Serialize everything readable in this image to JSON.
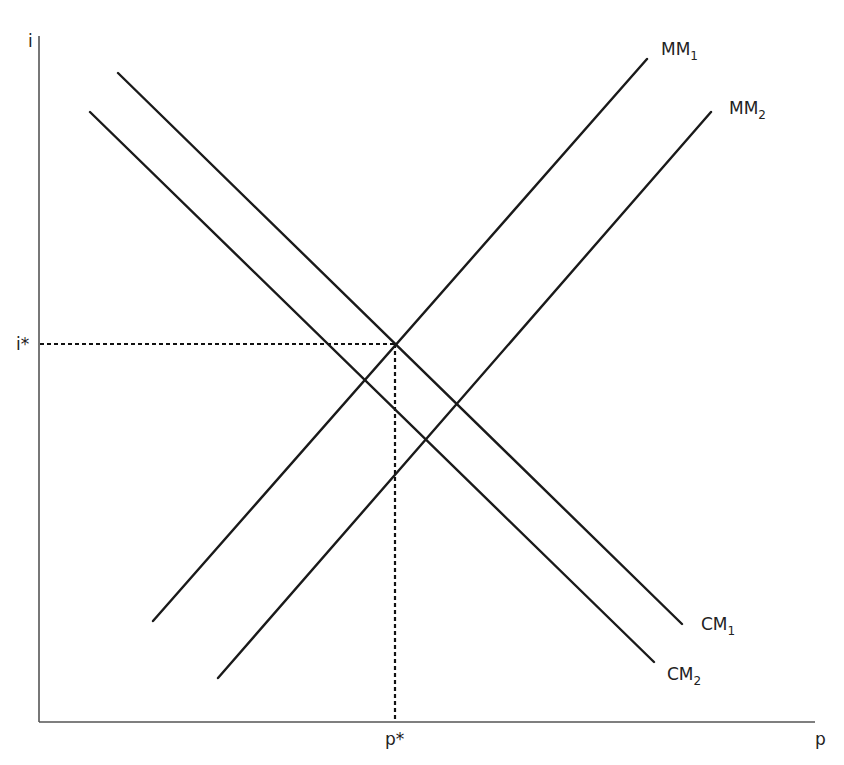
{
  "diagram": {
    "axes": {
      "y_label": "i",
      "x_label": "p"
    },
    "equilibrium": {
      "i_label": "i*",
      "p_label": "p*"
    },
    "curves": [
      {
        "id": "MM1",
        "base": "MM",
        "sub": "1",
        "x1": 153,
        "y1": 621,
        "x2": 647,
        "y2": 59
      },
      {
        "id": "MM2",
        "base": "MM",
        "sub": "2",
        "x1": 218,
        "y1": 678,
        "x2": 711,
        "y2": 112
      },
      {
        "id": "CM1",
        "base": "CM",
        "sub": "1",
        "x1": 118,
        "y1": 73,
        "x2": 682,
        "y2": 624
      },
      {
        "id": "CM2",
        "base": "CM",
        "sub": "2",
        "x1": 90,
        "y1": 112,
        "x2": 654,
        "y2": 662
      }
    ],
    "line_color": "#1a1a1a",
    "axis_color": "#555555"
  },
  "chart_data": {
    "type": "line",
    "title": "",
    "xlabel": "p",
    "ylabel": "i",
    "series": [
      {
        "name": "MM1",
        "direction": "upward-sloping"
      },
      {
        "name": "MM2",
        "direction": "upward-sloping (shifted right)"
      },
      {
        "name": "CM1",
        "direction": "downward-sloping"
      },
      {
        "name": "CM2",
        "direction": "downward-sloping (shifted left)"
      }
    ],
    "annotations": [
      "i*",
      "p*"
    ],
    "equilibrium": "MM1 ∩ CM1 at (p*, i*)"
  }
}
